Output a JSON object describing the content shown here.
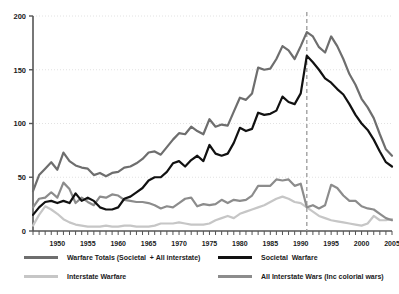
{
  "chart_data": {
    "type": "line",
    "title": "",
    "subtitle": "",
    "xlabel": "",
    "ylabel": "",
    "xlim": [
      1946,
      2005
    ],
    "ylim": [
      0,
      200
    ],
    "yticks": [
      0,
      50,
      100,
      150,
      200
    ],
    "xticks": [
      1950,
      1955,
      1960,
      1965,
      1970,
      1975,
      1980,
      1985,
      1990,
      1995,
      2000,
      2005
    ],
    "xtick_labels": [
      "1950",
      "1955",
      "1960",
      "1965",
      "1970",
      "1975",
      "1980",
      "1985",
      "1990",
      "1995",
      "2000",
      "2005"
    ],
    "ytick_labels": [
      "0",
      "50",
      "100",
      "150",
      "200"
    ],
    "minor_xticks_every": 1,
    "grid": "horizontal-dotted",
    "legend_position": "bottom",
    "annotations": [
      {
        "type": "vline",
        "x": 1991,
        "style": "dashed",
        "color": "#9a9a9a",
        "label": ""
      }
    ],
    "x": [
      1946,
      1947,
      1948,
      1949,
      1950,
      1951,
      1952,
      1953,
      1954,
      1955,
      1956,
      1957,
      1958,
      1959,
      1960,
      1961,
      1962,
      1963,
      1964,
      1965,
      1966,
      1967,
      1968,
      1969,
      1970,
      1971,
      1972,
      1973,
      1974,
      1975,
      1976,
      1977,
      1978,
      1979,
      1980,
      1981,
      1982,
      1983,
      1984,
      1985,
      1986,
      1987,
      1988,
      1989,
      1990,
      1991,
      1992,
      1993,
      1994,
      1995,
      1996,
      1997,
      1998,
      1999,
      2000,
      2001,
      2002,
      2003,
      2004,
      2005
    ],
    "series": [
      {
        "name": "Warfare Totals (Societal  + All interstate)",
        "color": "#6e6e6e",
        "width": 2.2,
        "values": [
          37,
          52,
          58,
          64,
          57,
          73,
          65,
          61,
          59,
          58,
          52,
          54,
          51,
          54,
          55,
          59,
          60,
          63,
          67,
          73,
          74,
          71,
          78,
          85,
          91,
          90,
          97,
          93,
          90,
          104,
          97,
          99,
          98,
          111,
          124,
          122,
          128,
          152,
          150,
          151,
          160,
          172,
          168,
          160,
          172,
          185,
          181,
          171,
          166,
          181,
          172,
          160,
          146,
          136,
          123,
          115,
          105,
          90,
          76,
          70
        ]
      },
      {
        "name": "Societal  Warfare",
        "color": "#111111",
        "width": 2.2,
        "values": [
          15,
          22,
          27,
          28,
          26,
          28,
          26,
          35,
          28,
          31,
          28,
          22,
          20,
          20,
          22,
          30,
          32,
          36,
          40,
          47,
          50,
          50,
          55,
          63,
          65,
          60,
          66,
          70,
          65,
          80,
          72,
          70,
          72,
          82,
          96,
          93,
          95,
          110,
          108,
          109,
          112,
          125,
          120,
          118,
          128,
          163,
          157,
          150,
          142,
          138,
          132,
          127,
          118,
          108,
          100,
          94,
          85,
          74,
          64,
          60
        ]
      },
      {
        "name": "Interstate Warfare",
        "color": "#c6c6c6",
        "width": 2.2,
        "values": [
          5,
          15,
          23,
          20,
          16,
          11,
          8,
          6,
          5,
          4,
          4,
          4,
          5,
          4,
          4,
          5,
          5,
          4,
          4,
          4,
          5,
          7,
          7,
          7,
          8,
          7,
          6,
          6,
          6,
          7,
          10,
          12,
          14,
          12,
          16,
          18,
          20,
          22,
          24,
          27,
          30,
          32,
          30,
          27,
          26,
          22,
          18,
          14,
          12,
          10,
          9,
          8,
          7,
          6,
          5,
          7,
          14,
          10,
          10,
          11
        ]
      },
      {
        "name": "All Interstate Wars (Inc colorial wars)",
        "color": "#8c8c8c",
        "width": 2.2,
        "values": [
          22,
          30,
          31,
          36,
          31,
          45,
          39,
          26,
          31,
          27,
          24,
          32,
          31,
          34,
          33,
          29,
          28,
          27,
          27,
          26,
          24,
          21,
          23,
          22,
          26,
          30,
          31,
          23,
          25,
          24,
          25,
          29,
          26,
          29,
          28,
          29,
          33,
          42,
          42,
          42,
          48,
          47,
          48,
          42,
          44,
          22,
          24,
          21,
          24,
          43,
          40,
          33,
          28,
          28,
          23,
          21,
          20,
          16,
          12,
          10
        ]
      }
    ]
  },
  "legend": {
    "entries": [
      {
        "label": "Warfare Totals (Societal  + All interstate)",
        "color": "#6e6e6e"
      },
      {
        "label": "Societal  Warfare",
        "color": "#111111"
      },
      {
        "label": "Interstate Warfare",
        "color": "#c6c6c6"
      },
      {
        "label": "All Interstate Wars (Inc colorial wars)",
        "color": "#8c8c8c"
      }
    ]
  },
  "axes": {
    "axis_color": "#555555",
    "grid_color": "#e2e2e2"
  }
}
